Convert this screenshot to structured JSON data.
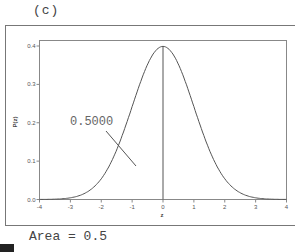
{
  "panel_label": "(c)",
  "footer": {
    "area_text": "Area = 0.5"
  },
  "chart_data": {
    "type": "line",
    "title": "",
    "xlabel": "z",
    "ylabel": "P(z)",
    "xlim": [
      -4,
      4
    ],
    "ylim": [
      0.0,
      0.4
    ],
    "x_ticks": [
      "-4",
      "-3",
      "-2",
      "-1",
      "0",
      "1",
      "2",
      "3",
      "4"
    ],
    "y_ticks": [
      "0.0",
      "0.1",
      "0.2",
      "0.3",
      "0.4"
    ],
    "grid": false,
    "series": [
      {
        "name": "Standard normal density",
        "x": [
          -4,
          -3.5,
          -3,
          -2.5,
          -2,
          -1.5,
          -1,
          -0.5,
          0,
          0.5,
          1,
          1.5,
          2,
          2.5,
          3,
          3.5,
          4
        ],
        "y": [
          0.0001,
          0.0009,
          0.0044,
          0.0175,
          0.054,
          0.1295,
          0.242,
          0.3521,
          0.3989,
          0.3521,
          0.242,
          0.1295,
          0.054,
          0.0175,
          0.0044,
          0.0009,
          0.0001
        ]
      }
    ],
    "annotations": [
      {
        "text": "0.5000",
        "kind": "shaded-area-label",
        "region": "z <= 0"
      },
      {
        "kind": "vertical-line",
        "x": 0
      }
    ],
    "area": 0.5
  }
}
